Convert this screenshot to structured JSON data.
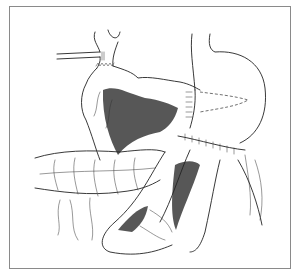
{
  "figure": {
    "type": "surgical line illustration",
    "border_color": "#8a8a8a",
    "line_color": "#222222",
    "background": "#ffffff"
  }
}
